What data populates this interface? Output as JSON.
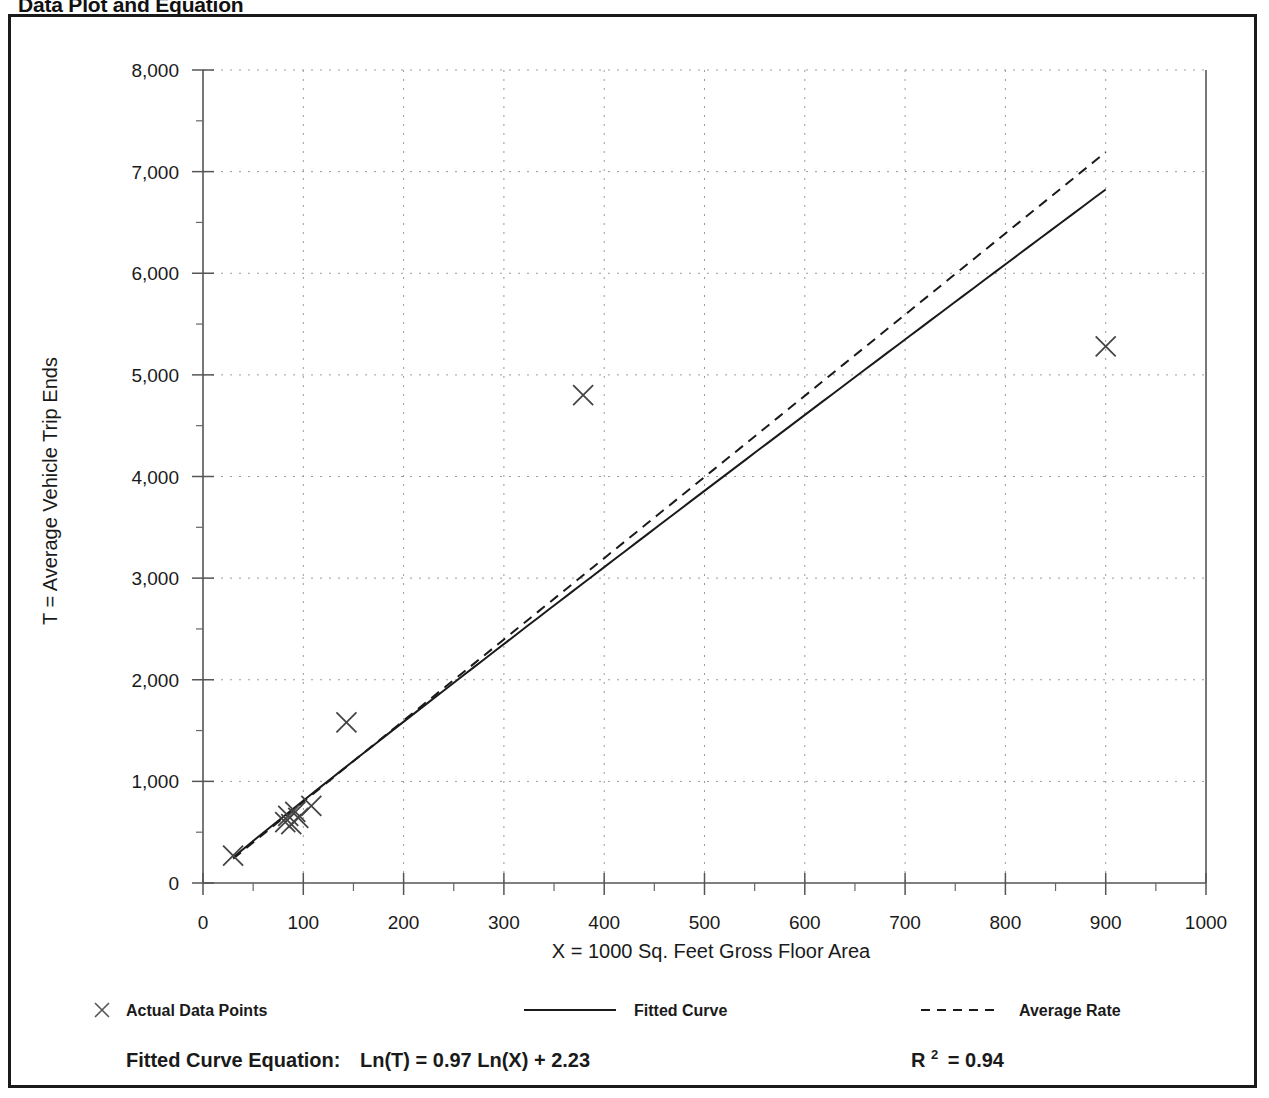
{
  "page_title": "Data Plot and Equation",
  "chart_data": {
    "type": "scatter",
    "title": "Data Plot and Equation",
    "xlabel": "X = 1000 Sq. Feet Gross Floor Area",
    "ylabel": "T = Average Vehicle Trip Ends",
    "xlim": [
      0,
      1000
    ],
    "ylim": [
      0,
      8000
    ],
    "xticks": [
      0,
      100,
      200,
      300,
      400,
      500,
      600,
      700,
      800,
      900,
      1000
    ],
    "xtick_labels": [
      "0",
      "100",
      "200",
      "300",
      "400",
      "500",
      "600",
      "700",
      "800",
      "900",
      "1000"
    ],
    "yticks": [
      0,
      1000,
      2000,
      3000,
      4000,
      5000,
      6000,
      7000,
      8000
    ],
    "ytick_labels": [
      "0",
      "1,000",
      "2,000",
      "3,000",
      "4,000",
      "5,000",
      "6,000",
      "7,000",
      "8,000"
    ],
    "x_minor_step": 50,
    "y_minor_step": 500,
    "grid": true,
    "grid_style": "dotted",
    "legend_position": "below-axis",
    "series": [
      {
        "name": "Actual Data Points",
        "type": "scatter",
        "marker": "x",
        "points": [
          {
            "x": 30,
            "y": 270
          },
          {
            "x": 82,
            "y": 600
          },
          {
            "x": 85,
            "y": 660
          },
          {
            "x": 88,
            "y": 580
          },
          {
            "x": 92,
            "y": 700
          },
          {
            "x": 95,
            "y": 640
          },
          {
            "x": 108,
            "y": 760
          },
          {
            "x": 143,
            "y": 1580
          },
          {
            "x": 379,
            "y": 4800
          },
          {
            "x": 900,
            "y": 5280
          }
        ]
      },
      {
        "name": "Fitted Curve",
        "type": "line",
        "style": "solid",
        "equation": "Ln(T) = 0.97 Ln(X) + 2.23",
        "slope_ln": 0.97,
        "intercept_ln": 2.23,
        "x_start": 30,
        "x_end": 900
      },
      {
        "name": "Average Rate",
        "type": "line",
        "style": "dashed",
        "rate": 7.99,
        "x_start": 30,
        "x_end": 900
      }
    ]
  },
  "legend": {
    "items": [
      {
        "label": "Actual Data Points",
        "marker": "x"
      },
      {
        "label": "Fitted Curve",
        "marker": "solid-line"
      },
      {
        "label": "Average Rate",
        "marker": "dashed-line"
      }
    ]
  },
  "footer": {
    "equation_label": "Fitted Curve Equation:",
    "equation_value": "Ln(T) = 0.97 Ln(X) + 2.23",
    "r2_symbol": "R",
    "r2_exponent": "2",
    "r2_value": "= 0.94"
  },
  "colors": {
    "ink": "#1a1a1a",
    "grid": "#9a9a9a",
    "frame": "#1a1a1a",
    "background": "#ffffff"
  }
}
